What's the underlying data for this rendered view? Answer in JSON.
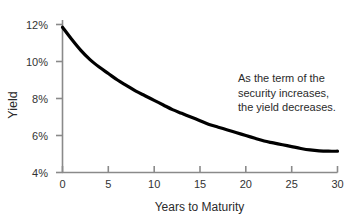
{
  "chart_data": {
    "type": "line",
    "title": "",
    "subtitle": "",
    "xlabel": "Years to Maturity",
    "ylabel": "Yield",
    "xlim": [
      0,
      30
    ],
    "ylim": [
      4,
      12
    ],
    "xticks": [
      "0",
      "5",
      "10",
      "15",
      "20",
      "25",
      "30"
    ],
    "xtick_values": [
      0,
      5,
      10,
      15,
      20,
      25,
      30
    ],
    "yticks": [
      "4%",
      "6%",
      "8%",
      "10%",
      "12%"
    ],
    "ytick_values": [
      4,
      6,
      8,
      10,
      12
    ],
    "grid": false,
    "legend": false,
    "series": [
      {
        "name": "Yield curve",
        "color": "#000000",
        "x": [
          0,
          1,
          2,
          3,
          4,
          5,
          6,
          7,
          8,
          9,
          10,
          11,
          12,
          13,
          14,
          15,
          16,
          17,
          18,
          19,
          20,
          21,
          22,
          23,
          24,
          25,
          26,
          27,
          28,
          29,
          30
        ],
        "values": [
          11.85,
          11.2,
          10.6,
          10.1,
          9.7,
          9.35,
          9.0,
          8.7,
          8.4,
          8.15,
          7.9,
          7.65,
          7.4,
          7.2,
          7.0,
          6.8,
          6.6,
          6.45,
          6.3,
          6.15,
          6.0,
          5.85,
          5.7,
          5.6,
          5.5,
          5.4,
          5.3,
          5.22,
          5.17,
          5.15,
          5.15
        ]
      }
    ],
    "annotations": [
      {
        "lines": [
          "As the term of the",
          "security increases,",
          "the yield decreases."
        ]
      }
    ],
    "colors": {
      "background": "#ffffff",
      "curve": "#000000",
      "axis": "#8a8a8a",
      "tick_text": "#333333",
      "label_text": "#2b2b2b"
    }
  },
  "annotation": {
    "line1": "As the term of the",
    "line2": "security increases,",
    "line3": "the yield decreases."
  },
  "axes": {
    "x_title": "Years to Maturity",
    "y_title": "Yield"
  },
  "ticks": {
    "y": [
      "12%",
      "10%",
      "8%",
      "6%",
      "4%"
    ],
    "x": [
      "0",
      "5",
      "10",
      "15",
      "20",
      "25",
      "30"
    ]
  },
  "title": ""
}
